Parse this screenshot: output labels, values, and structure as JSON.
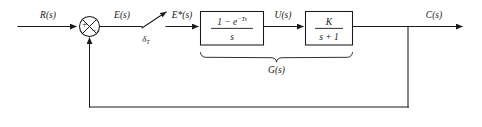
{
  "diagram": {
    "type": "control-system-block-diagram",
    "background_color": "#ffffff",
    "line_color": "#1a1a1a"
  },
  "signals": {
    "input": "R(s)",
    "error": "E(s)",
    "sampled_error": "E*(s)",
    "control": "U(s)",
    "output": "C(s)"
  },
  "sampler": {
    "label": "δ",
    "subscript": "T",
    "name": "impulse-sampler"
  },
  "summing_junction": {
    "input_sign": "+",
    "feedback_sign": "−"
  },
  "blocks": [
    {
      "id": "zero-order-hold",
      "numerator_prefix": "1 − e",
      "numerator_exponent": "−Ts",
      "denominator": "s"
    },
    {
      "id": "plant",
      "numerator": "K",
      "denominator": "s + 1"
    }
  ],
  "group_brace": {
    "label": "G(s)"
  },
  "feedback": {
    "path_type": "unity-feedback",
    "gain": "1"
  }
}
